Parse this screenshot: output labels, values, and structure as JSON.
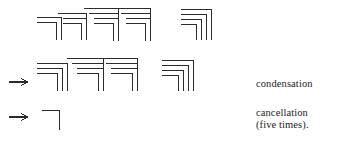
{
  "figure": {
    "stroke_color": "#2b2b2b",
    "background_color": "#ffffff",
    "stroke_width": 1
  },
  "labels": {
    "condensation": "condensation",
    "cancellation": "cancellation",
    "five_times": "(five times)."
  },
  "arrows": {
    "glyph": "→",
    "row2_label": "arrow-to-condensation",
    "row3_label": "arrow-to-cancellation"
  },
  "rows": [
    {
      "name": "row-1-initial-diagram",
      "groups": [
        {
          "name": "group-1a",
          "corners": [
            {
              "x": 37,
              "y": 17,
              "w": 24,
              "h": 23
            },
            {
              "x": 37,
              "y": 22,
              "w": 19,
              "h": 18
            }
          ]
        },
        {
          "name": "group-1b",
          "corners": [
            {
              "x": 58,
              "y": 13,
              "w": 28,
              "h": 27
            },
            {
              "x": 63,
              "y": 18,
              "w": 23,
              "h": 22
            },
            {
              "x": 63,
              "y": 23,
              "w": 18,
              "h": 17
            }
          ]
        },
        {
          "name": "group-1c",
          "corners": [
            {
              "x": 84,
              "y": 8,
              "w": 34,
              "h": 33
            },
            {
              "x": 89,
              "y": 13,
              "w": 29,
              "h": 28
            },
            {
              "x": 94,
              "y": 18,
              "w": 24,
              "h": 23
            },
            {
              "x": 94,
              "y": 23,
              "w": 19,
              "h": 18
            }
          ]
        },
        {
          "name": "group-1d",
          "corners": [
            {
              "x": 116,
              "y": 8,
              "w": 34,
              "h": 33
            },
            {
              "x": 121,
              "y": 13,
              "w": 29,
              "h": 28
            },
            {
              "x": 126,
              "y": 18,
              "w": 24,
              "h": 23
            },
            {
              "x": 126,
              "y": 23,
              "w": 19,
              "h": 18
            }
          ]
        },
        {
          "name": "group-1e",
          "corners": [
            {
              "x": 181,
              "y": 9,
              "w": 30,
              "h": 31
            },
            {
              "x": 181,
              "y": 14,
              "w": 25,
              "h": 26
            },
            {
              "x": 181,
              "y": 19,
              "w": 20,
              "h": 21
            },
            {
              "x": 181,
              "y": 24,
              "w": 15,
              "h": 16
            }
          ]
        }
      ]
    },
    {
      "name": "row-2-condensation",
      "groups": [
        {
          "name": "group-2a",
          "corners": [
            {
              "x": 37,
              "y": 63,
              "w": 30,
              "h": 28
            },
            {
              "x": 37,
              "y": 68,
              "w": 25,
              "h": 23
            },
            {
              "x": 37,
              "y": 73,
              "w": 20,
              "h": 18
            }
          ]
        },
        {
          "name": "group-2b",
          "corners": [
            {
              "x": 67,
              "y": 58,
              "w": 36,
              "h": 33
            },
            {
              "x": 72,
              "y": 63,
              "w": 31,
              "h": 28
            },
            {
              "x": 77,
              "y": 68,
              "w": 26,
              "h": 23
            },
            {
              "x": 77,
              "y": 73,
              "w": 21,
              "h": 18
            }
          ]
        },
        {
          "name": "group-2c",
          "corners": [
            {
              "x": 101,
              "y": 58,
              "w": 36,
              "h": 33
            },
            {
              "x": 106,
              "y": 63,
              "w": 31,
              "h": 28
            },
            {
              "x": 111,
              "y": 68,
              "w": 26,
              "h": 23
            },
            {
              "x": 111,
              "y": 73,
              "w": 21,
              "h": 18
            }
          ]
        },
        {
          "name": "group-2d",
          "corners": [
            {
              "x": 162,
              "y": 60,
              "w": 31,
              "h": 31
            },
            {
              "x": 162,
              "y": 65,
              "w": 26,
              "h": 26
            },
            {
              "x": 162,
              "y": 70,
              "w": 21,
              "h": 21
            },
            {
              "x": 162,
              "y": 75,
              "w": 16,
              "h": 16
            }
          ]
        }
      ]
    },
    {
      "name": "row-3-cancellation",
      "groups": [
        {
          "name": "group-3a",
          "corners": [
            {
              "x": 42,
              "y": 110,
              "w": 17,
              "h": 20
            }
          ]
        }
      ]
    }
  ]
}
